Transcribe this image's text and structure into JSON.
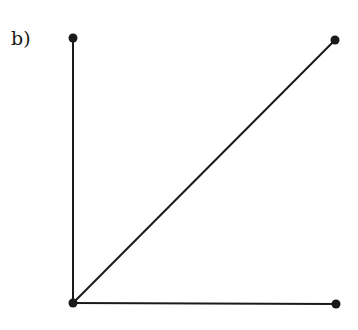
{
  "figure": {
    "label": "b)",
    "stroke_color": "#1a1a1a",
    "points": {
      "top_left": {
        "x": 73,
        "y": 38
      },
      "top_right": {
        "x": 335,
        "y": 40
      },
      "origin": {
        "x": 73,
        "y": 303
      },
      "bottom_right": {
        "x": 336,
        "y": 304
      }
    },
    "segments": [
      {
        "from": "origin",
        "to": "top_left"
      },
      {
        "from": "origin",
        "to": "top_right"
      },
      {
        "from": "origin",
        "to": "bottom_right"
      }
    ]
  }
}
